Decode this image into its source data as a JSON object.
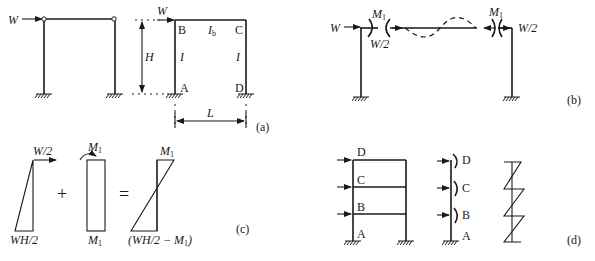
{
  "figure": {
    "panel_a": {
      "caption": "(a)",
      "load_left": "W",
      "load_right": "W",
      "height_label": "H",
      "span_label": "L",
      "beam_inertia": "I",
      "beam_inertia_sub": "b",
      "column_inertia_left": "I",
      "column_inertia_right": "I",
      "nodes": {
        "A": "A",
        "B": "B",
        "C": "C",
        "D": "D"
      }
    },
    "panel_b": {
      "caption": "(b)",
      "load": "W",
      "moment_left": "M",
      "moment_left_sub": "1",
      "moment_right": "M",
      "moment_right_sub": "1",
      "shear_left": "W/2",
      "shear_right": "W/2"
    },
    "panel_c": {
      "caption": "(c)",
      "top_force": "W/2",
      "base_moment": "WH/2",
      "plus": "+",
      "equals": "=",
      "moment_top_mid": "M",
      "moment_top_mid_sub": "1",
      "moment_bottom_mid": "M",
      "moment_bottom_mid_sub": "1",
      "result_top": "M",
      "result_top_sub": "1",
      "result_bottom_prefix": "(WH/2 − M",
      "result_bottom_sub": "1",
      "result_bottom_suffix": ")"
    },
    "panel_d": {
      "caption": "(d)",
      "frame_nodes": [
        "D",
        "C",
        "B",
        "A"
      ],
      "column_nodes": [
        "D",
        "C",
        "B",
        "A"
      ]
    }
  }
}
